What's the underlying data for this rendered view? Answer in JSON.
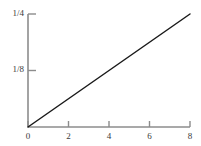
{
  "chart_data": {
    "type": "line",
    "title": "",
    "xlabel": "",
    "ylabel": "",
    "xlim": [
      0,
      8
    ],
    "ylim": [
      0,
      0.25
    ],
    "grid": false,
    "legend": null,
    "x_ticks": [
      {
        "value": 0,
        "label": "0"
      },
      {
        "value": 2,
        "label": "2"
      },
      {
        "value": 4,
        "label": "4"
      },
      {
        "value": 6,
        "label": "6"
      },
      {
        "value": 8,
        "label": "8"
      }
    ],
    "y_ticks": [
      {
        "value": 0.125,
        "label": "1/8"
      },
      {
        "value": 0.25,
        "label": "1/4"
      }
    ],
    "series": [
      {
        "name": "line",
        "x": [
          0,
          8
        ],
        "values": [
          0,
          0.25
        ],
        "color": "#1a1a1a"
      }
    ],
    "axis_color": "#8c8c8c",
    "text_color": "#3a3a3a",
    "background": "#ffffff"
  }
}
